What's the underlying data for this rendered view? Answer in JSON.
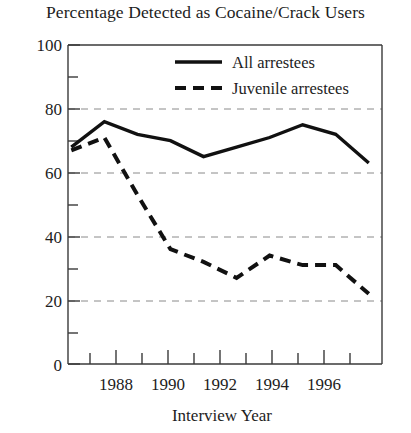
{
  "chart_data": {
    "type": "line",
    "title": "Percentage Detected as Cocaine/Crack Users",
    "xlabel": "Interview Year",
    "ylabel": "",
    "x": [
      1987,
      1988,
      1989,
      1990,
      1991,
      1992,
      1993,
      1994,
      1995,
      1996
    ],
    "xlim": [
      1986.9,
      1996.4
    ],
    "ylim": [
      0,
      100
    ],
    "xticks": [
      1987,
      1988,
      1989,
      1990,
      1991,
      1992,
      1993,
      1994,
      1995,
      1996
    ],
    "xtick_labels": [
      "",
      "1988",
      "",
      "1990",
      "",
      "1992",
      "",
      "1994",
      "",
      "1996"
    ],
    "yticks": [
      0,
      10,
      20,
      30,
      40,
      50,
      60,
      70,
      80,
      90,
      100
    ],
    "ytick_labels": [
      "0",
      "",
      "20",
      "",
      "40",
      "",
      "60",
      "",
      "80",
      "",
      "100"
    ],
    "grid": "horizontal dashed gridlines at 20, 40, 60, 80",
    "gridlines": [
      20,
      40,
      60,
      80
    ],
    "legend_position": "top center inside plot",
    "series": [
      {
        "name": "All arrestees",
        "style": "solid",
        "color": "#111111",
        "values": [
          68,
          76,
          72,
          70,
          65,
          68,
          71,
          75,
          72,
          63
        ]
      },
      {
        "name": "Juvenile arrestees",
        "style": "dashed",
        "color": "#111111",
        "values": [
          67,
          71,
          53,
          36,
          32,
          27,
          34,
          31,
          31,
          22
        ]
      }
    ]
  },
  "axis": {
    "y_labels": [
      "100",
      "80",
      "60",
      "40",
      "20",
      "0"
    ],
    "x_labels": [
      "1988",
      "1990",
      "1992",
      "1994",
      "1996"
    ],
    "x_title": "Interview Year"
  },
  "legend": {
    "items": [
      {
        "label": "All arrestees",
        "style": "solid"
      },
      {
        "label": "Juvenile arrestees",
        "style": "dashed"
      }
    ]
  },
  "colors": {
    "ink": "#1d1d1d",
    "line": "#111111",
    "grid": "#8a8a8a",
    "axis": "#3a3a3a",
    "background": "#ffffff"
  }
}
